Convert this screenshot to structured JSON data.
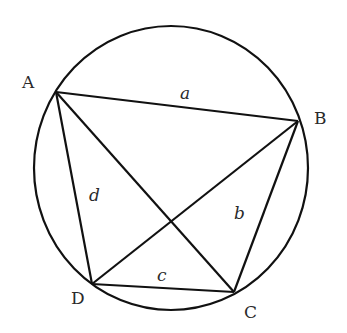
{
  "diagram": {
    "title": "",
    "circle": {
      "cx": 171,
      "cy": 168,
      "rx": 137,
      "ry": 142
    },
    "vertices": [
      {
        "id": "A",
        "label": "A",
        "x": 56,
        "y": 92,
        "lx": 30,
        "ly": 86
      },
      {
        "id": "B",
        "label": "B",
        "x": 298,
        "y": 121,
        "lx": 322,
        "ly": 123
      },
      {
        "id": "C",
        "label": "C",
        "x": 234,
        "y": 292,
        "lx": 251,
        "ly": 317
      },
      {
        "id": "D",
        "label": "D",
        "x": 92,
        "y": 284,
        "lx": 78,
        "ly": 303
      }
    ],
    "sides": [
      {
        "from": "A",
        "to": "B",
        "label": "a",
        "lx": 185,
        "ly": 99
      },
      {
        "from": "B",
        "to": "C",
        "label": "b",
        "lx": 239,
        "ly": 219
      },
      {
        "from": "C",
        "to": "D",
        "label": "c",
        "lx": 162,
        "ly": 280
      },
      {
        "from": "D",
        "to": "A",
        "label": "d",
        "lx": 94,
        "ly": 200
      }
    ],
    "diagonals": [
      {
        "from": "A",
        "to": "C"
      },
      {
        "from": "B",
        "to": "D"
      }
    ],
    "stroke_color": "#111111"
  }
}
